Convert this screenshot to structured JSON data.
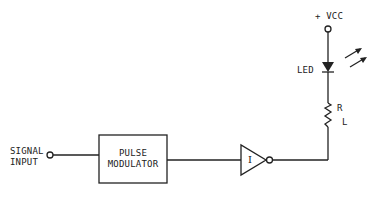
{
  "diagram": {
    "type": "circuit-schematic",
    "colors": {
      "stroke": "#222222",
      "background": "#ffffff"
    },
    "labels": {
      "signal_input_line1": "SIGNAL",
      "signal_input_line2": "INPUT",
      "modulator_line1": "PULSE",
      "modulator_line2": "MODULATOR",
      "inverter": "I",
      "vcc": "+ VCC",
      "led": "LED",
      "resistor_main": "R",
      "resistor_sub": "L"
    },
    "components": [
      {
        "id": "signal-input-terminal",
        "kind": "terminal"
      },
      {
        "id": "pulse-modulator",
        "kind": "block"
      },
      {
        "id": "inverter",
        "kind": "inverter-gate"
      },
      {
        "id": "vcc-terminal",
        "kind": "terminal"
      },
      {
        "id": "led",
        "kind": "light-emitting-diode"
      },
      {
        "id": "load-resistor",
        "kind": "resistor"
      }
    ]
  }
}
